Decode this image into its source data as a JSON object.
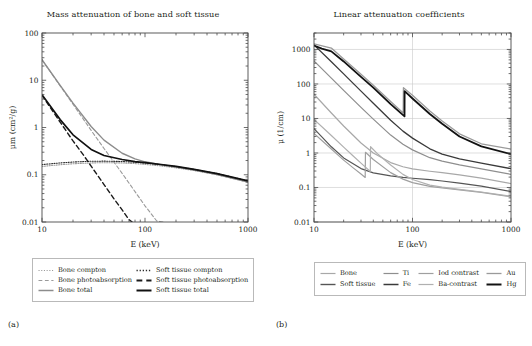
{
  "figure": {
    "width": 532,
    "height": 346,
    "background": "#ffffff",
    "panels": [
      {
        "id": "a",
        "sublabel": "(a)",
        "title": "Mass attenuation of bone and soft tissue"
      },
      {
        "id": "b",
        "sublabel": "(b)",
        "title": "Linear attenuation coefficients"
      }
    ]
  },
  "chart_data": [
    {
      "type": "line",
      "id": "mass-attenuation",
      "title": "Mass attenuation of bone and soft tissue",
      "xlabel": "E (keV)",
      "ylabel": "μm (cm²/g)",
      "xscale": "log",
      "yscale": "log",
      "xlim": [
        10,
        1000
      ],
      "ylim": [
        0.01,
        100
      ],
      "xticks": [
        10,
        100,
        1000
      ],
      "xtick_labels": [
        "10",
        "100",
        "1000"
      ],
      "yticks": [
        0.01,
        0.1,
        1,
        10,
        100
      ],
      "ytick_labels": [
        "0.01",
        "0.1",
        "1",
        "10",
        "100"
      ],
      "grid": false,
      "legend_position": "below",
      "series": [
        {
          "name": "Bone compton",
          "color": "#9a9a9a",
          "style": "dotted",
          "width": 1.1,
          "x": [
            10,
            15,
            20,
            30,
            40,
            60,
            80,
            100,
            150,
            200,
            300,
            500,
            1000
          ],
          "values": [
            0.15,
            0.163,
            0.171,
            0.178,
            0.18,
            0.178,
            0.172,
            0.166,
            0.152,
            0.14,
            0.123,
            0.1,
            0.07
          ]
        },
        {
          "name": "Bone photoabsorption",
          "color": "#9a9a9a",
          "style": "dashed",
          "width": 1.1,
          "x": [
            10,
            15,
            20,
            30,
            40,
            50,
            60,
            80,
            100,
            130,
            150
          ],
          "values": [
            27.0,
            7.6,
            3.1,
            0.87,
            0.36,
            0.185,
            0.107,
            0.044,
            0.022,
            0.0105,
            0.01
          ]
        },
        {
          "name": "Bone total",
          "color": "#8c8c8c",
          "style": "solid",
          "width": 1.4,
          "x": [
            10,
            15,
            20,
            30,
            40,
            60,
            80,
            100,
            150,
            200,
            300,
            500,
            1000
          ],
          "values": [
            27.2,
            7.76,
            3.27,
            1.05,
            0.54,
            0.285,
            0.216,
            0.188,
            0.16,
            0.145,
            0.126,
            0.101,
            0.07
          ]
        },
        {
          "name": "Soft tissue compton",
          "color": "#2b2b2b",
          "style": "dotted",
          "width": 1.1,
          "x": [
            10,
            15,
            20,
            30,
            40,
            60,
            80,
            100,
            150,
            200,
            300,
            500,
            1000
          ],
          "values": [
            0.164,
            0.178,
            0.186,
            0.193,
            0.194,
            0.191,
            0.184,
            0.177,
            0.162,
            0.149,
            0.13,
            0.106,
            0.074
          ]
        },
        {
          "name": "Soft tissue photoabsorption",
          "color": "#1a1a1a",
          "style": "dashed",
          "width": 1.4,
          "x": [
            10,
            15,
            20,
            25,
            30,
            40,
            50,
            60,
            70,
            75
          ],
          "values": [
            4.8,
            1.3,
            0.52,
            0.27,
            0.152,
            0.062,
            0.031,
            0.018,
            0.0112,
            0.01
          ]
        },
        {
          "name": "Soft tissue total",
          "color": "#101010",
          "style": "solid",
          "width": 1.7,
          "x": [
            10,
            15,
            20,
            30,
            40,
            60,
            80,
            100,
            150,
            200,
            300,
            500,
            1000
          ],
          "values": [
            4.95,
            1.47,
            0.7,
            0.343,
            0.256,
            0.21,
            0.19,
            0.18,
            0.163,
            0.15,
            0.13,
            0.106,
            0.074
          ]
        }
      ]
    },
    {
      "type": "line",
      "id": "linear-attenuation",
      "title": "Linear attenuation coefficients",
      "xlabel": "E (keV)",
      "ylabel": "μ (1/cm)",
      "xscale": "log",
      "yscale": "log",
      "xlim": [
        10,
        1000
      ],
      "ylim": [
        0.01,
        3000
      ],
      "xticks": [
        10,
        100,
        1000
      ],
      "xtick_labels": [
        "10",
        "100",
        "1000"
      ],
      "yticks": [
        0.01,
        0.1,
        1,
        10,
        100,
        1000
      ],
      "ytick_labels": [
        "0.01",
        "0.1",
        "1",
        "10",
        "100",
        "1000"
      ],
      "grid": true,
      "legend_position": "below",
      "series": [
        {
          "name": "Bone",
          "color": "#a8a8a8",
          "style": "solid",
          "width": 1.2,
          "x": [
            10,
            15,
            20,
            30,
            40,
            60,
            80,
            100,
            150,
            200,
            300,
            500,
            1000
          ],
          "values": [
            50.3,
            14.4,
            6.05,
            1.94,
            1.0,
            0.527,
            0.4,
            0.348,
            0.296,
            0.268,
            0.233,
            0.187,
            0.13
          ]
        },
        {
          "name": "Soft tissue",
          "color": "#555555",
          "style": "solid",
          "width": 1.2,
          "x": [
            10,
            15,
            20,
            30,
            40,
            60,
            80,
            100,
            150,
            200,
            300,
            500,
            1000
          ],
          "values": [
            5.1,
            1.51,
            0.721,
            0.353,
            0.264,
            0.216,
            0.196,
            0.185,
            0.168,
            0.154,
            0.134,
            0.109,
            0.076
          ]
        },
        {
          "name": "Ti",
          "color": "#8e8e8e",
          "style": "solid",
          "width": 1.2,
          "x": [
            10,
            15,
            20,
            30,
            40,
            60,
            80,
            100,
            150,
            200,
            300,
            500,
            1000
          ],
          "values": [
            464,
            148,
            65.0,
            21.0,
            9.6,
            3.3,
            1.8,
            1.23,
            0.73,
            0.58,
            0.45,
            0.345,
            0.24
          ]
        },
        {
          "name": "Fe",
          "color": "#3a3a3a",
          "style": "solid",
          "width": 1.3,
          "x": [
            10,
            15,
            20,
            30,
            40,
            60,
            80,
            100,
            150,
            200,
            300,
            500,
            1000
          ],
          "values": [
            1360,
            440,
            196,
            62.0,
            27.5,
            8.9,
            4.3,
            2.7,
            1.32,
            0.93,
            0.68,
            0.51,
            0.35
          ]
        },
        {
          "name": "Iod contrast",
          "color": "#9f9f9f",
          "style": "solid",
          "width": 1.2,
          "k_edge": 33.2,
          "x": [
            10,
            15,
            20,
            25,
            30,
            33.1,
            33.3,
            40,
            60,
            80,
            100,
            150,
            200,
            300,
            500,
            1000
          ],
          "values": [
            3.7,
            1.3,
            0.62,
            0.37,
            0.245,
            0.195,
            1.05,
            0.65,
            0.27,
            0.175,
            0.138,
            0.108,
            0.097,
            0.085,
            0.072,
            0.054
          ]
        },
        {
          "name": "Ba-contrast",
          "color": "#b0b0b0",
          "style": "solid",
          "width": 1.2,
          "k_edge": 37.4,
          "x": [
            10,
            15,
            20,
            25,
            30,
            37.3,
            37.5,
            45,
            60,
            80,
            100,
            150,
            200,
            300,
            500,
            1000
          ],
          "values": [
            9.4,
            3.2,
            1.48,
            0.82,
            0.51,
            0.29,
            1.52,
            0.9,
            0.45,
            0.24,
            0.17,
            0.117,
            0.102,
            0.088,
            0.074,
            0.056
          ]
        },
        {
          "name": "Au",
          "color": "#9a9a9a",
          "style": "solid",
          "width": 1.3,
          "k_edge": 80.7,
          "x": [
            10,
            15,
            20,
            30,
            40,
            60,
            80.5,
            80.9,
            100,
            150,
            200,
            300,
            500,
            1000
          ],
          "values": [
            1450,
            1100,
            530,
            190,
            92.0,
            31.0,
            14.5,
            78.0,
            47.0,
            16.5,
            8.5,
            3.6,
            1.85,
            1.3
          ]
        },
        {
          "name": "Hg",
          "color": "#121212",
          "style": "solid",
          "width": 1.8,
          "k_edge": 83.1,
          "x": [
            10,
            12,
            15,
            20,
            30,
            40,
            60,
            83.0,
            83.2,
            100,
            150,
            200,
            300,
            500,
            1000
          ],
          "values": [
            1300,
            1060,
            880,
            450,
            160,
            78.0,
            26.0,
            11.5,
            62.0,
            38.0,
            13.5,
            7.0,
            3.0,
            1.55,
            0.93
          ]
        }
      ]
    }
  ],
  "legends": {
    "a": {
      "items": [
        {
          "label": "Bone compton",
          "color": "#9a9a9a",
          "style": "dotted",
          "width": 1.2
        },
        {
          "label": "Soft tissue compton",
          "color": "#2b2b2b",
          "style": "dotted",
          "width": 1.4
        },
        {
          "label": "Bone photoabsorption",
          "color": "#9a9a9a",
          "style": "dashed",
          "width": 1.2
        },
        {
          "label": "Soft tissue photoabsorption",
          "color": "#1a1a1a",
          "style": "dashed",
          "width": 1.8
        },
        {
          "label": "Bone total",
          "color": "#8c8c8c",
          "style": "solid",
          "width": 1.5
        },
        {
          "label": "Soft tissue total",
          "color": "#101010",
          "style": "solid",
          "width": 2.0
        }
      ]
    },
    "b": {
      "items": [
        {
          "label": "Bone",
          "color": "#a8a8a8",
          "style": "solid",
          "width": 1.2
        },
        {
          "label": "Ti",
          "color": "#8e8e8e",
          "style": "solid",
          "width": 1.2
        },
        {
          "label": "Iod contrast",
          "color": "#9f9f9f",
          "style": "solid",
          "width": 1.2
        },
        {
          "label": "Au",
          "color": "#9a9a9a",
          "style": "solid",
          "width": 1.3
        },
        {
          "label": "Soft tissue",
          "color": "#555555",
          "style": "solid",
          "width": 1.4
        },
        {
          "label": "Fe",
          "color": "#3a3a3a",
          "style": "solid",
          "width": 1.5
        },
        {
          "label": "Ba-contrast",
          "color": "#b0b0b0",
          "style": "solid",
          "width": 1.2
        },
        {
          "label": "Hg",
          "color": "#121212",
          "style": "solid",
          "width": 2.0
        }
      ]
    }
  }
}
